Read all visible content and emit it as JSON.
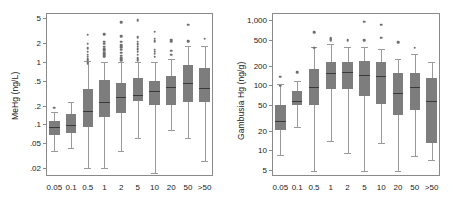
{
  "chart_data": [
    {
      "type": "box",
      "panel": "left",
      "title": "",
      "xlabel": "",
      "ylabel": "MeHg (ng/L)",
      "yscale": "log",
      "ylim": [
        0.015,
        6.0
      ],
      "yticks": [
        5,
        2,
        1,
        0.5,
        0.2,
        0.1,
        0.05,
        0.02
      ],
      "ytick_labels": [
        "5",
        "2",
        "1",
        ".5",
        ".2",
        ".1",
        ".05",
        ".02"
      ],
      "categories": [
        "0.05",
        "0.1",
        "0.5",
        "1",
        "2",
        "5",
        "10",
        "20",
        "50",
        ">50"
      ],
      "grid": false,
      "legend": "none",
      "boxes": [
        {
          "category": "0.05",
          "whisker_low": 0.037,
          "q1": 0.068,
          "median": 0.092,
          "q3": 0.115,
          "whisker_high": 0.155,
          "outliers": [
            0.185
          ]
        },
        {
          "category": "0.1",
          "whisker_low": 0.042,
          "q1": 0.073,
          "median": 0.098,
          "q3": 0.148,
          "whisker_high": 0.225,
          "outliers": []
        },
        {
          "category": "0.5",
          "whisker_low": 0.02,
          "q1": 0.092,
          "median": 0.165,
          "q3": 0.37,
          "whisker_high": 1.02,
          "outliers": [
            0.95,
            1.05,
            1.12,
            1.2,
            1.3,
            1.45,
            1.65,
            1.95,
            2.7
          ]
        },
        {
          "category": "1",
          "whisker_low": 0.02,
          "q1": 0.133,
          "median": 0.225,
          "q3": 0.505,
          "whisker_high": 1.0,
          "outliers": [
            1.2,
            1.25,
            1.3,
            1.35,
            1.4,
            1.5,
            1.6,
            1.75,
            1.95,
            2.1,
            2.75
          ]
        },
        {
          "category": "2",
          "whisker_low": 0.037,
          "q1": 0.15,
          "median": 0.275,
          "q3": 0.455,
          "whisker_high": 1.0,
          "outliers": [
            1.05,
            1.15,
            1.25,
            1.4,
            1.55,
            1.7,
            1.85,
            2.1,
            2.55,
            4.3
          ]
        },
        {
          "category": "5",
          "whisker_low": 0.06,
          "q1": 0.235,
          "median": 0.3,
          "q3": 0.545,
          "whisker_high": 1.0,
          "outliers": [
            1.05,
            1.15,
            1.3,
            1.45,
            1.6,
            1.75,
            1.9,
            2.1,
            2.45,
            4.6
          ]
        },
        {
          "category": "10",
          "whisker_low": 0.017,
          "q1": 0.205,
          "median": 0.34,
          "q3": 0.485,
          "whisker_high": 1.0,
          "outliers": [
            1.2,
            1.35,
            1.45,
            1.55,
            2.15,
            2.35,
            3.0
          ]
        },
        {
          "category": "20",
          "whisker_low": 0.08,
          "q1": 0.205,
          "median": 0.395,
          "q3": 0.585,
          "whisker_high": 1.1,
          "outliers": [
            1.3,
            1.5,
            2.15,
            2.25
          ]
        },
        {
          "category": "50",
          "whisker_low": 0.06,
          "q1": 0.225,
          "median": 0.465,
          "q3": 0.9,
          "whisker_high": 1.8,
          "outliers": [
            2.15,
            3.9
          ]
        },
        {
          "category": ">50",
          "whisker_low": 0.026,
          "q1": 0.225,
          "median": 0.375,
          "q3": 0.805,
          "whisker_high": 1.8,
          "outliers": [
            2.35
          ]
        }
      ]
    },
    {
      "type": "box",
      "panel": "right",
      "title": "",
      "xlabel": "",
      "ylabel": "Gambusia Hg (ng/g)",
      "yscale": "log",
      "ylim": [
        4.0,
        1300
      ],
      "yticks": [
        1000,
        500,
        200,
        100,
        50,
        20,
        10,
        5
      ],
      "ytick_labels": [
        "1,000",
        "500",
        "200",
        "100",
        "50",
        "20",
        "10",
        "5"
      ],
      "categories": [
        "0.05",
        "0.1",
        "0.5",
        "1",
        "2",
        "5",
        "10",
        "20",
        "50",
        ">50"
      ],
      "grid": false,
      "legend": "none",
      "boxes": [
        {
          "category": "0.05",
          "whisker_low": 8.5,
          "q1": 20.5,
          "median": 28.0,
          "q3": 50.0,
          "whisker_high": 105.0,
          "outliers": [
            98.0,
            135.0
          ]
        },
        {
          "category": "0.1",
          "whisker_low": 23.0,
          "q1": 50.0,
          "median": 57.0,
          "q3": 82.0,
          "whisker_high": 118.0,
          "outliers": [
            160.0
          ]
        },
        {
          "category": "0.5",
          "whisker_low": 4.8,
          "q1": 50.0,
          "median": 95.0,
          "q3": 180.0,
          "whisker_high": 390.0,
          "outliers": [
            380.0,
            660.0
          ]
        },
        {
          "category": "1",
          "whisker_low": 14.0,
          "q1": 88.0,
          "median": 155.0,
          "q3": 230.0,
          "whisker_high": 430.0,
          "outliers": [
            490.0,
            510.0,
            530.0
          ]
        },
        {
          "category": "2",
          "whisker_low": 9.0,
          "q1": 88.0,
          "median": 160.0,
          "q3": 230.0,
          "whisker_high": 390.0,
          "outliers": [
            500.0
          ]
        },
        {
          "category": "5",
          "whisker_low": 4.8,
          "q1": 68.0,
          "median": 145.0,
          "q3": 235.0,
          "whisker_high": 395.0,
          "outliers": [
            490.0,
            950.0
          ]
        },
        {
          "category": "10",
          "whisker_low": 13.0,
          "q1": 52.0,
          "median": 140.0,
          "q3": 230.0,
          "whisker_high": 360.0,
          "outliers": [
            540.0,
            860.0
          ]
        },
        {
          "category": "20",
          "whisker_low": 4.8,
          "q1": 35.0,
          "median": 75.0,
          "q3": 155.0,
          "whisker_high": 255.0,
          "outliers": [
            460.0
          ]
        },
        {
          "category": "50",
          "whisker_low": 8.0,
          "q1": 42.0,
          "median": 95.0,
          "q3": 155.0,
          "whisker_high": 300.0,
          "outliers": [
            380.0
          ]
        },
        {
          "category": ">50",
          "whisker_low": 7.0,
          "q1": 13.0,
          "median": 58.0,
          "q3": 130.0,
          "whisker_high": 230.0,
          "outliers": []
        }
      ]
    }
  ],
  "style": {
    "box_fill": "#7d7d7d",
    "median_color": "#3a3a3a",
    "whisker_color": "#9a9a9a",
    "outlier_color": "#6e6e6e",
    "frame_color": "#8a8a8a",
    "text_color": "#1a1a1a",
    "background": "#ffffff"
  },
  "geometry": {
    "panels": [
      {
        "id": "left",
        "frame": {
          "x": 46,
          "y": 13,
          "w": 167,
          "h": 163
        },
        "label_x": 10,
        "label_y": 120
      },
      {
        "id": "right",
        "frame": {
          "x": 45,
          "y": 13,
          "w": 168,
          "h": 163
        },
        "label_x": 9,
        "label_y": 140
      }
    ]
  }
}
